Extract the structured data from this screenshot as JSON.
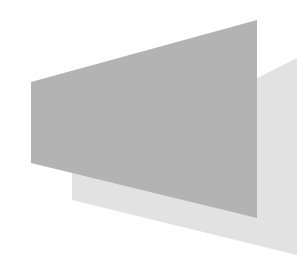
{
  "background": "#ffffff",
  "shapes": {
    "back_panel": {
      "label": "light-gray-trapezoid",
      "color": "#e2e2e2",
      "points": "72,172 297,58 297,255 72,200"
    },
    "front_panel": {
      "label": "gray-trapezoid",
      "color": "#b3b3b3",
      "points": "31,82 257,20 257,218 31,163"
    }
  }
}
